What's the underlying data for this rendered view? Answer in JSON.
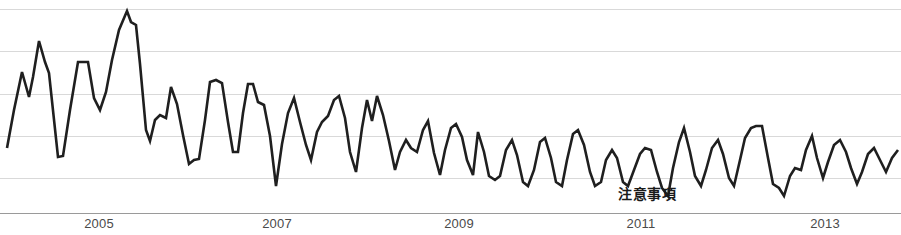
{
  "chart_data": {
    "type": "line",
    "title": "",
    "subtitle": "",
    "xlabel": "",
    "ylabel": "",
    "grid": true,
    "gridlines_y": [
      9,
      51,
      94,
      136,
      178
    ],
    "legend_position": "none",
    "axis": {
      "x_tick_labels": [
        "2005",
        "2007",
        "2009",
        "2011",
        "2013"
      ],
      "x_tick_positions_px": [
        99,
        277,
        459,
        641,
        825
      ],
      "x_range": [
        "2004",
        "2014"
      ],
      "y_axis_visible": false,
      "y_tick_labels": []
    },
    "series": [
      {
        "name": "series-1",
        "color": "#1f1f1f",
        "points_px": [
          [
            7,
            148
          ],
          [
            14,
            110
          ],
          [
            22,
            72
          ],
          [
            29,
            97
          ],
          [
            33,
            77
          ],
          [
            39,
            41
          ],
          [
            45,
            62
          ],
          [
            49,
            73
          ],
          [
            58,
            157
          ],
          [
            63,
            156
          ],
          [
            70,
            110
          ],
          [
            78,
            62
          ],
          [
            84,
            62
          ],
          [
            88,
            62
          ],
          [
            94,
            98
          ],
          [
            100,
            110
          ],
          [
            106,
            92
          ],
          [
            112,
            60
          ],
          [
            119,
            30
          ],
          [
            127,
            11
          ],
          [
            131,
            22
          ],
          [
            136,
            25
          ],
          [
            140,
            64
          ],
          [
            146,
            130
          ],
          [
            150,
            141
          ],
          [
            155,
            120
          ],
          [
            160,
            115
          ],
          [
            166,
            118
          ],
          [
            171,
            87
          ],
          [
            177,
            104
          ],
          [
            183,
            135
          ],
          [
            189,
            164
          ],
          [
            194,
            160
          ],
          [
            199,
            159
          ],
          [
            205,
            120
          ],
          [
            210,
            82
          ],
          [
            216,
            80
          ],
          [
            222,
            83
          ],
          [
            228,
            122
          ],
          [
            233,
            152
          ],
          [
            238,
            152
          ],
          [
            243,
            113
          ],
          [
            248,
            84
          ],
          [
            253,
            84
          ],
          [
            258,
            102
          ],
          [
            264,
            105
          ],
          [
            270,
            136
          ],
          [
            276,
            186
          ],
          [
            282,
            144
          ],
          [
            288,
            113
          ],
          [
            294,
            98
          ],
          [
            300,
            122
          ],
          [
            306,
            145
          ],
          [
            311,
            160
          ],
          [
            317,
            132
          ],
          [
            322,
            122
          ],
          [
            328,
            116
          ],
          [
            334,
            100
          ],
          [
            339,
            96
          ],
          [
            345,
            118
          ],
          [
            350,
            152
          ],
          [
            356,
            172
          ],
          [
            362,
            128
          ],
          [
            367,
            100
          ],
          [
            372,
            121
          ],
          [
            377,
            96
          ],
          [
            383,
            115
          ],
          [
            389,
            141
          ],
          [
            395,
            170
          ],
          [
            400,
            152
          ],
          [
            406,
            140
          ],
          [
            411,
            148
          ],
          [
            417,
            152
          ],
          [
            423,
            130
          ],
          [
            428,
            121
          ],
          [
            434,
            153
          ],
          [
            440,
            175
          ],
          [
            445,
            150
          ],
          [
            451,
            128
          ],
          [
            456,
            124
          ],
          [
            462,
            137
          ],
          [
            467,
            160
          ],
          [
            473,
            175
          ],
          [
            478,
            132
          ],
          [
            484,
            152
          ],
          [
            489,
            176
          ],
          [
            495,
            180
          ],
          [
            500,
            176
          ],
          [
            506,
            150
          ],
          [
            512,
            140
          ],
          [
            517,
            155
          ],
          [
            523,
            182
          ],
          [
            528,
            186
          ],
          [
            534,
            170
          ],
          [
            540,
            142
          ],
          [
            545,
            138
          ],
          [
            551,
            158
          ],
          [
            556,
            182
          ],
          [
            562,
            186
          ],
          [
            567,
            160
          ],
          [
            573,
            134
          ],
          [
            578,
            130
          ],
          [
            584,
            145
          ],
          [
            590,
            172
          ],
          [
            595,
            186
          ],
          [
            601,
            182
          ],
          [
            606,
            160
          ],
          [
            612,
            150
          ],
          [
            617,
            158
          ],
          [
            623,
            182
          ],
          [
            628,
            186
          ],
          [
            634,
            170
          ],
          [
            640,
            154
          ],
          [
            645,
            148
          ],
          [
            651,
            150
          ],
          [
            657,
            172
          ],
          [
            662,
            188
          ],
          [
            668,
            196
          ],
          [
            673,
            168
          ],
          [
            679,
            142
          ],
          [
            684,
            128
          ],
          [
            690,
            152
          ],
          [
            695,
            176
          ],
          [
            701,
            186
          ],
          [
            706,
            170
          ],
          [
            712,
            148
          ],
          [
            718,
            140
          ],
          [
            723,
            154
          ],
          [
            729,
            178
          ],
          [
            734,
            186
          ],
          [
            740,
            160
          ],
          [
            745,
            138
          ],
          [
            751,
            128
          ],
          [
            756,
            126
          ],
          [
            762,
            126
          ],
          [
            768,
            158
          ],
          [
            773,
            184
          ],
          [
            779,
            188
          ],
          [
            784,
            196
          ],
          [
            790,
            176
          ],
          [
            795,
            168
          ],
          [
            801,
            170
          ],
          [
            806,
            150
          ],
          [
            812,
            136
          ],
          [
            817,
            158
          ],
          [
            823,
            178
          ],
          [
            828,
            162
          ],
          [
            834,
            145
          ],
          [
            840,
            140
          ],
          [
            846,
            152
          ],
          [
            851,
            168
          ],
          [
            857,
            184
          ],
          [
            862,
            172
          ],
          [
            868,
            154
          ],
          [
            874,
            148
          ],
          [
            880,
            160
          ],
          [
            886,
            172
          ],
          [
            892,
            158
          ],
          [
            898,
            150
          ]
        ]
      }
    ],
    "annotations": [
      {
        "id": "note-label",
        "text": "注意事項",
        "x_px": 647,
        "y_px": 203
      }
    ]
  }
}
